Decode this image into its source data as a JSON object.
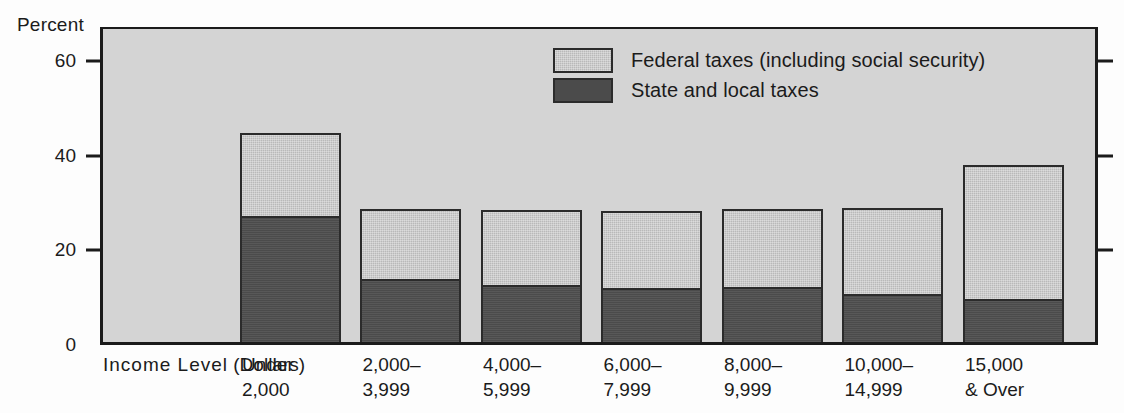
{
  "axis": {
    "y_title": "Percent",
    "y_ticks": [
      {
        "value": 60,
        "label": "60"
      },
      {
        "value": 40,
        "label": "40"
      },
      {
        "value": 20,
        "label": "20"
      },
      {
        "value": 0,
        "label": "0"
      }
    ],
    "x_caption_line1": "Income  Level",
    "x_caption_line2": "(Dollars)"
  },
  "legend": {
    "items": [
      {
        "label": "Federal taxes (including social security)",
        "swatch": "light",
        "color": "#b9b9b9"
      },
      {
        "label": "State and local taxes",
        "swatch": "dark",
        "color": "#4b4b4b"
      }
    ]
  },
  "chart_data": {
    "type": "bar",
    "title": "",
    "subtitle": "",
    "xlabel": "Income Level (Dollars)",
    "ylabel": "Percent",
    "ylim": [
      0,
      65
    ],
    "yticks": [
      0,
      20,
      40,
      60
    ],
    "grid": false,
    "stacked": true,
    "legend_position": "top-center-right",
    "categories": [
      "Under 2,000",
      "2,000-3,999",
      "4,000-5,999",
      "6,000-7,999",
      "8,000-9,999",
      "10,000-14,999",
      "15,000 & Over"
    ],
    "category_lines": [
      {
        "line1": "Under",
        "line2": "2,000"
      },
      {
        "line1": "2,000–",
        "line2": "3,999"
      },
      {
        "line1": "4,000–",
        "line2": "5,999"
      },
      {
        "line1": "6,000–",
        "line2": "7,999"
      },
      {
        "line1": "8,000–",
        "line2": "9,999"
      },
      {
        "line1": "10,000–",
        "line2": "14,999"
      },
      {
        "line1": "15,000",
        "line2": "& Over"
      }
    ],
    "series": [
      {
        "name": "State and local taxes",
        "color": "#4b4b4b",
        "values": [
          27.0,
          13.7,
          12.4,
          11.8,
          12.0,
          10.5,
          9.5
        ]
      },
      {
        "name": "Federal taxes (including social security)",
        "color": "#b9b9b9",
        "values": [
          17.2,
          14.3,
          15.4,
          15.8,
          16.0,
          17.7,
          27.8
        ]
      }
    ],
    "totals": [
      44.2,
      28.0,
      27.8,
      27.6,
      28.0,
      28.2,
      37.3
    ]
  }
}
